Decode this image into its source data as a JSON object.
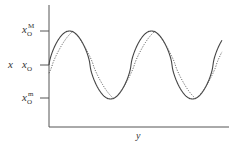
{
  "chart_data": {
    "type": "line",
    "title": "",
    "xlabel": "y",
    "ylabel": "x",
    "y_ticks": [
      {
        "label": "x_O^M",
        "base": "x",
        "sub": "O",
        "sup": "M",
        "value": 1
      },
      {
        "label": "x_O",
        "base": "x",
        "sub": "O",
        "sup": "",
        "value": 0
      },
      {
        "label": "x_O^m",
        "base": "x",
        "sub": "O",
        "sup": "m",
        "value": -1
      }
    ],
    "ylim": [
      -1.9,
      1.8
    ],
    "x_range_periods": 2.1,
    "grid": false,
    "legend": null,
    "series": [
      {
        "name": "solid curve",
        "style": "solid",
        "shape": "rounded sinusoid",
        "amplitude": 1,
        "phase_shift": 0
      },
      {
        "name": "dotted curve",
        "style": "dotted",
        "shape": "triangular-ish sinusoid",
        "amplitude": 1,
        "phase_shift": 0.04
      }
    ]
  },
  "labels": {
    "y_axis": "x",
    "x_axis": "y",
    "tick_max_base": "x",
    "tick_max_sub": "O",
    "tick_max_sup": "M",
    "tick_mid_base": "x",
    "tick_mid_sub": "O",
    "tick_min_base": "x",
    "tick_min_sub": "O",
    "tick_min_sup": "m"
  },
  "colors": {
    "axis": "#555555",
    "curve": "#444444",
    "text": "#333333"
  }
}
